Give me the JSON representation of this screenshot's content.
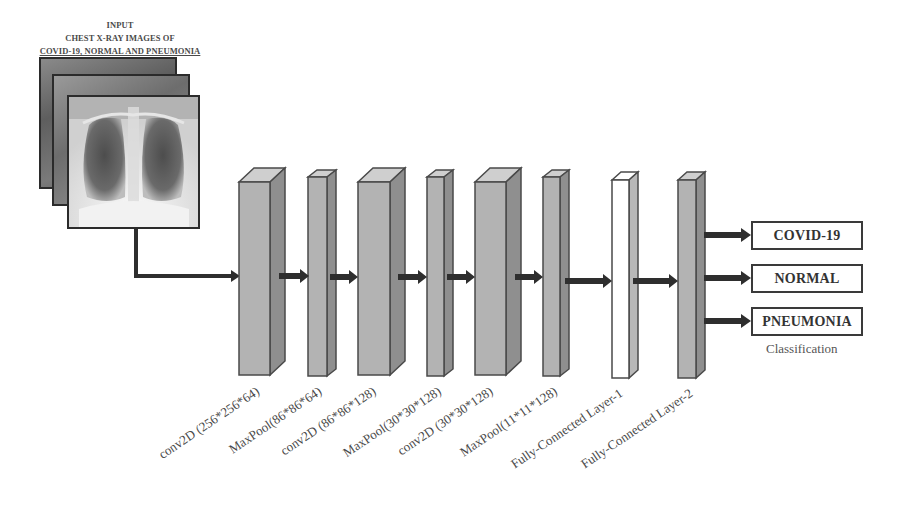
{
  "input": {
    "title_lines": [
      "INPUT",
      "CHEST X-RAY IMAGES OF",
      "COVID-19, NORMAL AND PNEUMONIA"
    ],
    "image_stack": [
      "chest-xray-back",
      "chest-xray-middle",
      "chest-xray-front"
    ]
  },
  "layers": [
    {
      "type": "conv",
      "label": "conv2D (256*256*64)",
      "fill": "#b3b3b3"
    },
    {
      "type": "pool",
      "label": "MaxPool(86*86*64)",
      "fill": "#b3b3b3"
    },
    {
      "type": "conv",
      "label": "conv2D (86*86*128)",
      "fill": "#b3b3b3"
    },
    {
      "type": "pool",
      "label": "MaxPool(30*30*128)",
      "fill": "#b3b3b3"
    },
    {
      "type": "conv",
      "label": "conv2D (30*30*128)",
      "fill": "#b3b3b3"
    },
    {
      "type": "pool",
      "label": "MaxPool(11*11*128)",
      "fill": "#b3b3b3"
    },
    {
      "type": "fc",
      "label": "Fully-Connected Layer-1",
      "fill": "#ffffff"
    },
    {
      "type": "fc",
      "label": "Fully-Connected Layer-2",
      "fill": "#b3b3b3"
    }
  ],
  "outputs": {
    "classes": [
      "COVID-19",
      "NORMAL",
      "PNEUMONIA"
    ],
    "caption": "Classification"
  },
  "colors": {
    "block_front": "#b3b3b3",
    "block_top": "#cfcfcf",
    "block_side": "#8f8f8f",
    "block_edge": "#4a4a4a",
    "arrow": "#2e2e2e",
    "fc1_front": "#ffffff"
  }
}
